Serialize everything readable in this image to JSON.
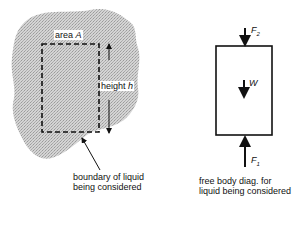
{
  "left_diagram": {
    "area_label": "area",
    "area_symbol": "A",
    "height_label": "height",
    "height_symbol": "h",
    "boundary_caption_line1": "boundary of liquid",
    "boundary_caption_line2": "being considered"
  },
  "right_diagram": {
    "force_top": "F",
    "force_top_sub": "2",
    "weight": "W",
    "force_bottom": "F",
    "force_bottom_sub": "1",
    "caption_line1": "free body diag. for",
    "caption_line2": "liquid being considered"
  },
  "colors": {
    "liquid_fill": "#c8c8c8",
    "line": "#111111"
  }
}
